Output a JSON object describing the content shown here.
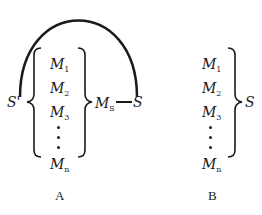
{
  "diagram_a": {
    "caption": "A",
    "outer_label": "S'",
    "inner_group_label": "M",
    "inner_group_sub": "S",
    "connected_label": "S",
    "items": [
      {
        "name": "M",
        "sub": "1"
      },
      {
        "name": "M",
        "sub": "2"
      },
      {
        "name": "M",
        "sub": "3"
      },
      {
        "name": "M",
        "sub": "n"
      }
    ]
  },
  "diagram_b": {
    "caption": "B",
    "group_label": "S",
    "items": [
      {
        "name": "M",
        "sub": "1"
      },
      {
        "name": "M",
        "sub": "2"
      },
      {
        "name": "M",
        "sub": "3"
      },
      {
        "name": "M",
        "sub": "n"
      }
    ]
  },
  "colors": {
    "stroke": "#1a1a1a",
    "background": "#ffffff"
  }
}
